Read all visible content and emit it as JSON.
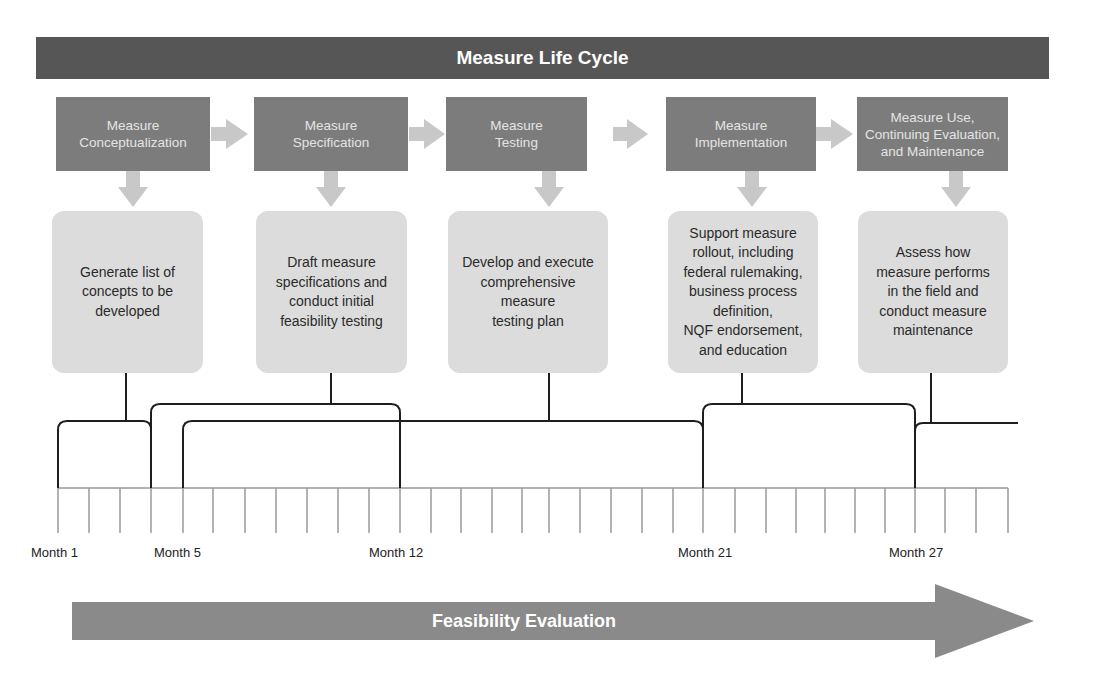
{
  "title": "Measure Life Cycle",
  "phases": [
    {
      "label": "Measure\nConceptualization",
      "description": "Generate list of\nconcepts to be\ndeveloped"
    },
    {
      "label": "Measure\nSpecification",
      "description": "Draft measure\nspecifications and\nconduct initial\nfeasibility testing"
    },
    {
      "label": "Measure\nTesting",
      "description": "Develop and execute\ncomprehensive\nmeasure\ntesting plan"
    },
    {
      "label": "Measure\nImplementation",
      "description": "Support measure\nrollout, including\nfederal rulemaking,\nbusiness process\ndefinition,\nNQF endorsement,\nand education"
    },
    {
      "label": "Measure Use,\nContinuing Evaluation,\nand Maintenance",
      "description": "Assess how\nmeasure performs\nin the field and\nconduct measure\nmaintenance"
    }
  ],
  "timeline": {
    "months": [
      {
        "label": "Month 1",
        "month": 1
      },
      {
        "label": "Month 5",
        "month": 5
      },
      {
        "label": "Month 12",
        "month": 12
      },
      {
        "label": "Month 21",
        "month": 21
      },
      {
        "label": "Month 27",
        "month": 27
      }
    ],
    "tick_count": 32,
    "phase_spans": [
      {
        "phase": "Measure Conceptualization",
        "start_month": 1,
        "end_month": 4
      },
      {
        "phase": "Measure Specification",
        "start_month": 4,
        "end_month": 12
      },
      {
        "phase": "Measure Testing",
        "start_month": 5,
        "end_month": 21
      },
      {
        "phase": "Measure Implementation",
        "start_month": 21,
        "end_month": 27
      },
      {
        "phase": "Measure Use, Continuing Evaluation, and Maintenance",
        "start_month": 27,
        "end_month": "ongoing"
      }
    ]
  },
  "bottom_arrow": {
    "label": "Feasibility Evaluation"
  },
  "colors": {
    "title_bar": "#565656",
    "phase_box": "#7c7c7c",
    "description_box": "#dcdcdc",
    "connector_arrow": "#c8c8c8",
    "bottom_arrow": "#8a8a8a",
    "bracket_line": "#1e1e1e",
    "tick_line": "#9a9a9a"
  }
}
